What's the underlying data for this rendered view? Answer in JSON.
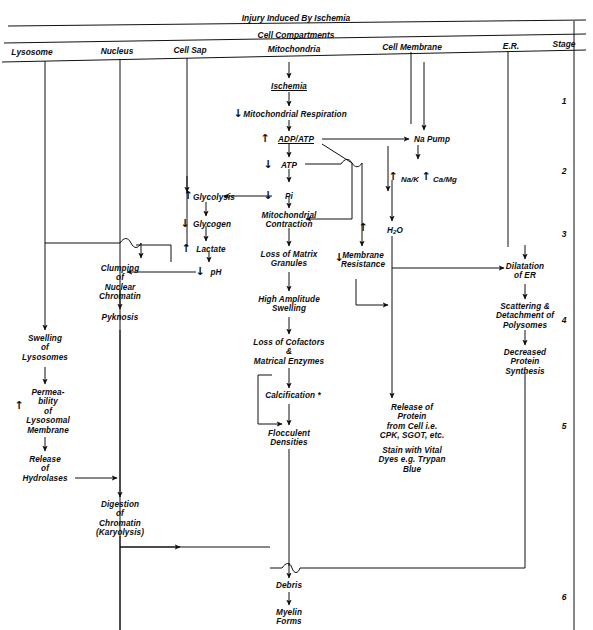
{
  "header": {
    "title": "Injury Induced By Ischemia",
    "band": "Cell Compartments",
    "columns": [
      {
        "key": "lysosome",
        "label": "Lysosome"
      },
      {
        "key": "nucleus",
        "label": "Nucleus"
      },
      {
        "key": "cell_sap",
        "label": "Cell Sap"
      },
      {
        "key": "mitochondria",
        "label": "Mitochondria"
      },
      {
        "key": "cell_membrane",
        "label": "Cell Membrane"
      },
      {
        "key": "er",
        "label": "E.R."
      },
      {
        "key": "stage",
        "label": "Stage"
      }
    ]
  },
  "stages": [
    {
      "label": "1"
    },
    {
      "label": "2"
    },
    {
      "label": "3"
    },
    {
      "label": "4"
    },
    {
      "label": "5"
    },
    {
      "label": "6"
    }
  ],
  "nodes": {
    "ischemia": "Ischemia",
    "mito_respiration": "Mitochondrial Respiration",
    "adp_atp": "ADP/ATP",
    "atp": "ATP",
    "pi": "Pi",
    "mito_contraction": "Mitochondrial\nContraction",
    "loss_matrix_granules": "Loss of Matrix\nGranules",
    "high_amplitude_swelling": "High Amplitude\nSwelling",
    "loss_cofactors": "Loss of Cofactors\n&\nMatrical Enzymes",
    "calcification": "Calcification *",
    "flocculent_densities": "Flocculent\nDensities",
    "na_pump": "Na Pump",
    "na_k": "Na/K",
    "ca_mg": "Ca/Mg",
    "h2o": "H",
    "h2o_sub": "2",
    "h2o_tail": "O",
    "membrane_resistance": "Membrane\nResistance",
    "release_protein": "Release of\nProtein\nfrom Cell i.e.\nCPK, SGOT, etc.",
    "stain_vital": "Stain with Vital\nDyes e.g. Trypan\nBlue",
    "glycolysis": "Glycolysis",
    "glycogen": "Glycogen",
    "lactate": "Lactate",
    "ph": "pH",
    "clumping": "Clumping\nof\nNuclear\nChromatin",
    "pyknosis": "Pyknosis",
    "digestion": "Digestion\nof\nChromatin\n(Karyolysis)",
    "swelling_lysosomes": "Swelling\nof\nLysosomes",
    "permeability": "Permea-\nbility\nof\nLysosomal\nMembrane",
    "release_hydrolases": "Release\nof\nHydrolases",
    "dilatation_er": "Dilatation\nof ER",
    "scattering": "Scattering &\nDetachment of\nPolysomes",
    "decreased_protein": "Decreased\nProtein\nSynthesis",
    "debris": "Debris",
    "myelin": "Myelin\nForms"
  },
  "glyphs": {
    "down": "↓",
    "up": "↑"
  },
  "colors": {
    "ink": "#0d0d0d",
    "background": "#ffffff",
    "line": "#1a1a1a"
  }
}
